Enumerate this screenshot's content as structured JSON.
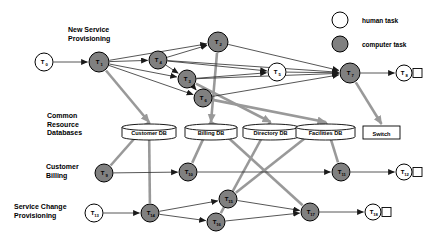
{
  "legend": {
    "items": [
      {
        "name": "human-task",
        "label": "human task",
        "fill": "#ffffff",
        "stroke": "#000000"
      },
      {
        "name": "computer-task",
        "label": "computer task",
        "fill": "#808080",
        "stroke": "#000000"
      }
    ]
  },
  "row_labels": [
    {
      "id": "new-service-provisioning",
      "text": "New Service\nProvisioning",
      "x": 68,
      "y": 30
    },
    {
      "id": "common-resource-databases",
      "text": "Common\nResource\nDatabases",
      "x": 47,
      "y": 116
    },
    {
      "id": "customer-billing",
      "text": "Customer\nBilling",
      "x": 46,
      "y": 166
    },
    {
      "id": "service-change-provisioning",
      "text": "Service Change\nProvisioning",
      "x": 14,
      "y": 206
    }
  ],
  "tasks": [
    {
      "id": "T0",
      "label": "T",
      "sub": "0",
      "x": 44,
      "y": 62,
      "r": 9,
      "type": "human"
    },
    {
      "id": "T1",
      "label": "T",
      "sub": "1",
      "x": 99,
      "y": 62,
      "r": 10,
      "type": "computer"
    },
    {
      "id": "T2",
      "label": "T",
      "sub": "2",
      "x": 218,
      "y": 42,
      "r": 10,
      "type": "computer"
    },
    {
      "id": "T4",
      "label": "T",
      "sub": "4",
      "x": 158,
      "y": 60,
      "r": 9,
      "type": "computer"
    },
    {
      "id": "T3",
      "label": "T",
      "sub": "3",
      "x": 187,
      "y": 79,
      "r": 9,
      "type": "computer"
    },
    {
      "id": "T6",
      "label": "T",
      "sub": "6",
      "x": 203,
      "y": 98,
      "r": 9,
      "type": "computer"
    },
    {
      "id": "T5",
      "label": "T",
      "sub": "5",
      "x": 277,
      "y": 72,
      "r": 9,
      "type": "human"
    },
    {
      "id": "T7",
      "label": "T",
      "sub": "7",
      "x": 350,
      "y": 73,
      "r": 10,
      "type": "computer"
    },
    {
      "id": "T8",
      "label": "T",
      "sub": "8",
      "x": 404,
      "y": 73,
      "r": 8,
      "type": "human",
      "terminal": true
    },
    {
      "id": "T9",
      "label": "T",
      "sub": "9",
      "x": 104,
      "y": 173,
      "r": 9,
      "type": "computer"
    },
    {
      "id": "T10",
      "label": "T",
      "sub": "10",
      "x": 188,
      "y": 172,
      "r": 9,
      "type": "computer"
    },
    {
      "id": "T11",
      "label": "T",
      "sub": "11",
      "x": 341,
      "y": 172,
      "r": 9,
      "type": "computer"
    },
    {
      "id": "T12",
      "label": "T",
      "sub": "12",
      "x": 404,
      "y": 172,
      "r": 8,
      "type": "human",
      "terminal": true
    },
    {
      "id": "T13",
      "label": "T",
      "sub": "13",
      "x": 94,
      "y": 213,
      "r": 9,
      "type": "human"
    },
    {
      "id": "T14",
      "label": "T",
      "sub": "14",
      "x": 150,
      "y": 213,
      "r": 9,
      "type": "computer"
    },
    {
      "id": "T15",
      "label": "T",
      "sub": "15",
      "x": 228,
      "y": 199,
      "r": 9,
      "type": "computer"
    },
    {
      "id": "T16",
      "label": "T",
      "sub": "16",
      "x": 216,
      "y": 222,
      "r": 9,
      "type": "computer"
    },
    {
      "id": "T17",
      "label": "T",
      "sub": "17",
      "x": 310,
      "y": 212,
      "r": 9,
      "type": "computer"
    },
    {
      "id": "T18",
      "label": "T",
      "sub": "18",
      "x": 373,
      "y": 212,
      "r": 8,
      "type": "human",
      "terminal": true
    }
  ],
  "stores": [
    {
      "id": "customer-db",
      "label": "Customer DB",
      "x": 122,
      "y": 124,
      "w": 54,
      "h": 16,
      "shape": "cylinder"
    },
    {
      "id": "billing-db",
      "label": "Billing DB",
      "x": 185,
      "y": 124,
      "w": 52,
      "h": 16,
      "shape": "cylinder"
    },
    {
      "id": "directory-db",
      "label": "Directory DB",
      "x": 243,
      "y": 124,
      "w": 55,
      "h": 16,
      "shape": "cylinder"
    },
    {
      "id": "facilities-db",
      "label": "Facilities DB",
      "x": 296,
      "y": 124,
      "w": 59,
      "h": 16,
      "shape": "cylinder"
    },
    {
      "id": "switch",
      "label": "Switch",
      "x": 363,
      "y": 126,
      "w": 37,
      "h": 13,
      "shape": "rect"
    }
  ],
  "colors": {
    "computer_fill": "#808080",
    "human_fill": "#ffffff",
    "control_edge": "#444444",
    "data_edge": "#999999",
    "text": "#000000"
  },
  "edges_control": [
    [
      "T0",
      "T1"
    ],
    [
      "T1",
      "T4"
    ],
    [
      "T1",
      "T2"
    ],
    [
      "T1",
      "T3"
    ],
    [
      "T1",
      "T6"
    ],
    [
      "T4",
      "T2"
    ],
    [
      "T4",
      "T3"
    ],
    [
      "T4",
      "T5"
    ],
    [
      "T3",
      "T6"
    ],
    [
      "T3",
      "T5"
    ],
    [
      "T2",
      "T7"
    ],
    [
      "T4",
      "T7"
    ],
    [
      "T3",
      "T7"
    ],
    [
      "T6",
      "T7"
    ],
    [
      "T5",
      "T7"
    ],
    [
      "T7",
      "T8"
    ],
    [
      "T9",
      "T10"
    ],
    [
      "T10",
      "T11"
    ],
    [
      "T11",
      "T12"
    ],
    [
      "T13",
      "T14"
    ],
    [
      "T14",
      "T15"
    ],
    [
      "T14",
      "T16"
    ],
    [
      "T15",
      "T17"
    ],
    [
      "T16",
      "T17"
    ],
    [
      "T17",
      "T18"
    ]
  ],
  "edges_data": [
    [
      "T1",
      "customer-db"
    ],
    [
      "T2",
      "billing-db"
    ],
    [
      "T3",
      "directory-db"
    ],
    [
      "T6",
      "facilities-db"
    ],
    [
      "T7",
      "switch"
    ],
    [
      "T9",
      "customer-db"
    ],
    [
      "T10",
      "billing-db"
    ],
    [
      "T14",
      "customer-db"
    ],
    [
      "T15",
      "facilities-db"
    ],
    [
      "T16",
      "directory-db"
    ],
    [
      "T17",
      "billing-db"
    ],
    [
      "T11",
      "facilities-db"
    ]
  ]
}
